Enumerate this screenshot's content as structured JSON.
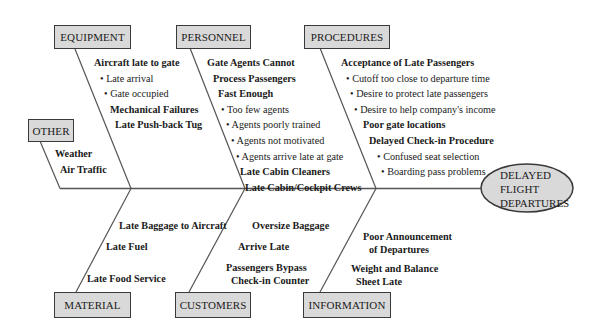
{
  "diagram": {
    "type": "fishbone",
    "effect": {
      "lines": [
        "DELAYED",
        "FLIGHT",
        "DEPARTURES"
      ],
      "fill": "#d9d9d9"
    },
    "colors": {
      "box_fill": "#d9d9d9",
      "line": "#555555",
      "border": "#3a3a3a"
    },
    "categories": {
      "equipment": {
        "label": "EQUIPMENT",
        "causes": [
          {
            "text": "Aircraft late to gate",
            "bold": true
          },
          {
            "text": "Late arrival",
            "bold": false,
            "bullet": true
          },
          {
            "text": "Gate occupied",
            "bold": false,
            "bullet": true
          },
          {
            "text": "Mechanical Failures",
            "bold": true
          },
          {
            "text": "Late Push-back Tug",
            "bold": true
          }
        ]
      },
      "personnel": {
        "label": "PERSONNEL",
        "causes": [
          {
            "text": "Gate Agents Cannot",
            "bold": true
          },
          {
            "text": "Process Passengers",
            "bold": true
          },
          {
            "text": "Fast Enough",
            "bold": true
          },
          {
            "text": "Too few agents",
            "bold": false,
            "bullet": true
          },
          {
            "text": "Agents poorly trained",
            "bold": false,
            "bullet": true
          },
          {
            "text": "Agents not motivated",
            "bold": false,
            "bullet": true
          },
          {
            "text": "Agents arrive late at gate",
            "bold": false,
            "bullet": true
          },
          {
            "text": "Late Cabin Cleaners",
            "bold": true
          },
          {
            "text": "Late Cabin/Cockpit Crews",
            "bold": true
          }
        ]
      },
      "procedures": {
        "label": "PROCEDURES",
        "causes": [
          {
            "text": "Acceptance of Late Passengers",
            "bold": true
          },
          {
            "text": "Cutoff too close to departure time",
            "bold": false,
            "bullet": true
          },
          {
            "text": "Desire to protect late passengers",
            "bold": false,
            "bullet": true
          },
          {
            "text": "Desire to help company's income",
            "bold": false,
            "bullet": true
          },
          {
            "text": "Poor gate locations",
            "bold": true
          },
          {
            "text": "Delayed Check-in Procedure",
            "bold": true
          },
          {
            "text": "Confused seat selection",
            "bold": false,
            "bullet": true
          },
          {
            "text": "Boarding pass problems",
            "bold": false,
            "bullet": true
          }
        ]
      },
      "other": {
        "label": "OTHER",
        "causes": [
          {
            "text": "Weather",
            "bold": true
          },
          {
            "text": "Air Traffic",
            "bold": true
          }
        ]
      },
      "material": {
        "label": "MATERIAL",
        "causes": [
          {
            "text": "Late Baggage to Aircraft",
            "bold": true
          },
          {
            "text": "Late Fuel",
            "bold": true
          },
          {
            "text": "Late Food Service",
            "bold": true
          }
        ]
      },
      "customers": {
        "label": "CUSTOMERS",
        "causes": [
          {
            "text": "Oversize Baggage",
            "bold": true
          },
          {
            "text": "Arrive Late",
            "bold": true
          },
          {
            "text": "Passengers Bypass",
            "bold": true
          },
          {
            "text": "Check-in Counter",
            "bold": true
          }
        ]
      },
      "information": {
        "label": "INFORMATION",
        "causes": [
          {
            "text": "Poor Announcement",
            "bold": true
          },
          {
            "text": "of Departures",
            "bold": true
          },
          {
            "text": "Weight and Balance",
            "bold": true
          },
          {
            "text": "Sheet Late",
            "bold": true
          }
        ]
      }
    }
  }
}
